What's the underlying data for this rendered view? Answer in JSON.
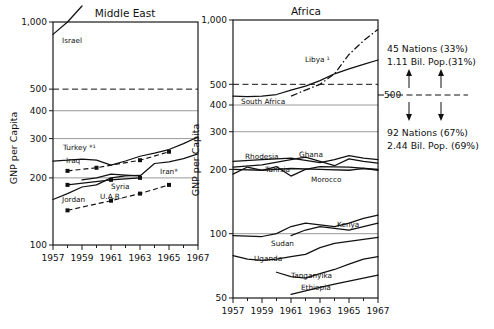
{
  "chart_data": [
    {
      "type": "line",
      "title": "Middle East",
      "xlabel": "",
      "ylabel": "GNP per Capita",
      "xlim": [
        1957,
        1967
      ],
      "ylim": [
        100,
        1000
      ],
      "yscale": "log",
      "yticks": [
        100,
        200,
        300,
        400,
        500,
        1000
      ],
      "ytick_labels": [
        "100",
        "200",
        "300",
        "400",
        "500",
        "1,000"
      ],
      "xticks": [
        1957,
        1959,
        1961,
        1963,
        1965,
        1967
      ],
      "xtick_labels": [
        "1957",
        "1959",
        "1961",
        "1963",
        "1965",
        "1967"
      ],
      "grid": true,
      "legend": "inline-labels",
      "reference_line": {
        "value": 500,
        "style": "dashed"
      },
      "series": [
        {
          "name": "Israel",
          "style": "solid",
          "markers": false,
          "x": [
            1957,
            1958,
            1959
          ],
          "values": [
            880,
            1000,
            1180
          ]
        },
        {
          "name": "Turkey",
          "label": "Turkey *¹",
          "style": "solid",
          "markers": false,
          "x": [
            1957,
            1958,
            1959,
            1960,
            1961,
            1962,
            1963,
            1964,
            1965,
            1966,
            1967
          ],
          "values": [
            238,
            240,
            243,
            240,
            228,
            238,
            250,
            258,
            268,
            285,
            305
          ]
        },
        {
          "name": "Iraq",
          "style": "dashed",
          "markers": true,
          "x": [
            1958,
            1960,
            1963,
            1965
          ],
          "values": [
            215,
            222,
            240,
            262
          ]
        },
        {
          "name": "Iran",
          "label": "Iran*",
          "style": "solid",
          "markers": false,
          "x": [
            1959,
            1960,
            1961,
            1962,
            1963,
            1964,
            1965,
            1966,
            1967
          ],
          "values": [
            196,
            200,
            208,
            206,
            204,
            232,
            236,
            244,
            256
          ]
        },
        {
          "name": "Syria",
          "style": "solid",
          "markers": false,
          "x": [
            1957,
            1958,
            1959,
            1960,
            1961,
            1962,
            1963
          ],
          "values": [
            160,
            170,
            182,
            186,
            200,
            204,
            205
          ]
        },
        {
          "name": "Jordan",
          "style": "solid",
          "markers": true,
          "x": [
            1958,
            1961,
            1963
          ],
          "values": [
            186,
            196,
            200
          ]
        },
        {
          "name": "U.A.R.",
          "style": "dashed",
          "markers": true,
          "x": [
            1958,
            1961,
            1963,
            1965
          ],
          "values": [
            143,
            158,
            170,
            186
          ]
        }
      ]
    },
    {
      "type": "line",
      "title": "Africa",
      "xlabel": "",
      "ylabel": "GNP per Capita",
      "xlim": [
        1957,
        1967
      ],
      "ylim": [
        50,
        1000
      ],
      "yscale": "log",
      "yticks": [
        50,
        100,
        200,
        300,
        400,
        500,
        1000
      ],
      "ytick_labels": [
        "50",
        "100",
        "200",
        "300",
        "400",
        "500",
        "1,000"
      ],
      "xticks": [
        1957,
        1959,
        1961,
        1963,
        1965,
        1967
      ],
      "xtick_labels": [
        "1957",
        "1959",
        "1961",
        "1963",
        "1965",
        "1967"
      ],
      "grid": true,
      "legend": "inline-labels",
      "reference_line": {
        "value": 500,
        "style": "dashed"
      },
      "series": [
        {
          "name": "Libya",
          "label": "Libya ¹",
          "style": "dash-dot",
          "markers": false,
          "x": [
            1961,
            1962,
            1963,
            1964,
            1965,
            1966,
            1967
          ],
          "values": [
            440,
            470,
            500,
            560,
            690,
            800,
            905
          ]
        },
        {
          "name": "South Africa",
          "style": "solid",
          "markers": false,
          "x": [
            1957,
            1958,
            1959,
            1960,
            1961,
            1962,
            1963,
            1964,
            1965,
            1966,
            1967
          ],
          "values": [
            440,
            438,
            440,
            448,
            470,
            490,
            520,
            560,
            590,
            620,
            650
          ]
        },
        {
          "name": "Rhodesia",
          "style": "solid",
          "markers": false,
          "x": [
            1957,
            1959,
            1961,
            1963,
            1964,
            1965,
            1966,
            1967
          ],
          "values": [
            218,
            222,
            226,
            215,
            222,
            232,
            226,
            222
          ]
        },
        {
          "name": "Ghana",
          "style": "solid",
          "markers": false,
          "x": [
            1957,
            1959,
            1961,
            1962,
            1963,
            1964,
            1965,
            1966,
            1967
          ],
          "values": [
            205,
            210,
            222,
            228,
            218,
            208,
            224,
            218,
            214
          ]
        },
        {
          "name": "Tunisia",
          "style": "solid",
          "markers": false,
          "x": [
            1957,
            1958,
            1959,
            1960,
            1961,
            1962,
            1963,
            1965,
            1967
          ],
          "values": [
            190,
            205,
            198,
            206,
            186,
            200,
            206,
            205,
            200
          ]
        },
        {
          "name": "Morocco",
          "style": "solid",
          "markers": false,
          "x": [
            1957,
            1959,
            1961,
            1963,
            1965,
            1966,
            1967
          ],
          "values": [
            200,
            198,
            202,
            200,
            198,
            202,
            198
          ]
        },
        {
          "name": "Kenya",
          "style": "solid",
          "markers": false,
          "x": [
            1957,
            1959,
            1960,
            1961,
            1962,
            1963,
            1964,
            1965,
            1966,
            1967
          ],
          "values": [
            98,
            97,
            100,
            108,
            112,
            110,
            108,
            112,
            118,
            122
          ]
        },
        {
          "name": "Sudan",
          "style": "solid",
          "markers": false,
          "x": [
            1961,
            1962,
            1963,
            1964,
            1965,
            1966,
            1967
          ],
          "values": [
            98,
            104,
            108,
            106,
            104,
            108,
            112
          ]
        },
        {
          "name": "Uganda",
          "style": "solid",
          "markers": false,
          "x": [
            1957,
            1958,
            1959,
            1960,
            1961,
            1962,
            1963,
            1964,
            1965,
            1966,
            1967
          ],
          "values": [
            79,
            76,
            75,
            76,
            78,
            80,
            86,
            90,
            92,
            94,
            96
          ]
        },
        {
          "name": "Tanganyika",
          "style": "solid",
          "markers": false,
          "x": [
            1960,
            1961,
            1962,
            1963,
            1964,
            1965,
            1966,
            1967
          ],
          "values": [
            66,
            63,
            62,
            65,
            68,
            72,
            76,
            78
          ]
        },
        {
          "name": "Ethiopia",
          "style": "solid",
          "markers": false,
          "x": [
            1961,
            1962,
            1963,
            1964,
            1965,
            1966,
            1967
          ],
          "values": [
            52,
            54,
            56,
            58,
            60,
            62,
            64
          ]
        }
      ]
    }
  ],
  "annotation": {
    "upper_line1": "45 Nations (33%)",
    "upper_line2": "1.11 Bil. Pop.(31%)",
    "divider_label": "500",
    "lower_line1": "92 Nations (67%)",
    "lower_line2": "2.44 Bil. Pop. (69%)"
  },
  "left_chart": {
    "title": "Middle East",
    "ylabel": "GNP per Capita",
    "ytick_labels": [
      "1,000",
      "500",
      "400",
      "300",
      "200",
      "100"
    ],
    "xtick_labels": [
      "1957",
      "1959",
      "1961",
      "1963",
      "1965",
      "1967"
    ],
    "series_labels": {
      "israel": "Israel",
      "turkey": "Turkey *¹",
      "iraq": "Iraq",
      "iran": "Iran*",
      "syria": "Syria",
      "jordan": "Jordan",
      "uar": "U.A.R."
    }
  },
  "right_chart": {
    "title": "Africa",
    "ylabel": "GNP per Capita",
    "ytick_labels": [
      "1,000",
      "500",
      "400",
      "300",
      "200",
      "100",
      "50"
    ],
    "xtick_labels": [
      "1957",
      "1959",
      "1961",
      "1963",
      "1965",
      "1967"
    ],
    "series_labels": {
      "libya": "Libya ¹",
      "south_africa": "South Africa",
      "rhodesia": "Rhodesia",
      "ghana": "Ghana",
      "tunisia": "Tunisia",
      "morocco": "Morocco",
      "kenya": "Kenya",
      "sudan": "Sudan",
      "uganda": "Uganda",
      "tanganyika": "Tanganyika",
      "ethiopia": "Ethiopia"
    }
  }
}
